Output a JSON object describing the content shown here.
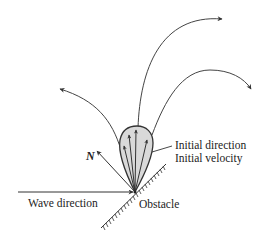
{
  "diagram": {
    "labels": {
      "wave_direction": "Wave direction",
      "obstacle": "Obstacle",
      "normal": "N",
      "initial_direction": "Initial direction",
      "initial_velocity": "Initial velocity"
    },
    "colors": {
      "stroke": "#333333",
      "teardrop_fill": "#d9d9d9",
      "background": "#ffffff"
    },
    "elements": {
      "impact_point": [
        135,
        192
      ],
      "trajectory_count": 3,
      "initial_velocity_arrow_count": 4
    }
  }
}
